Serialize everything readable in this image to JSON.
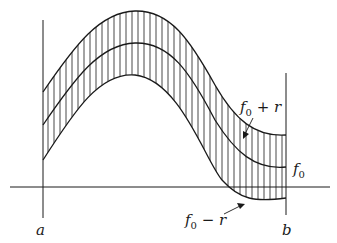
{
  "figure": {
    "stroke_color": "#1a1a1a",
    "background": "#ffffff",
    "labels": {
      "a": "a",
      "b": "b",
      "f0": "f",
      "f0_sub": "0",
      "upper_main": "f",
      "upper_sub": "0",
      "upper_rest": " + r",
      "lower_main": "f",
      "lower_sub": "0",
      "lower_rest": " − r"
    },
    "curves": [
      "f0 + r",
      "f0",
      "f0 − r"
    ],
    "axis": {
      "horizontal_y": 187,
      "left_vertical_x": 43,
      "right_vertical_x": 286
    }
  }
}
